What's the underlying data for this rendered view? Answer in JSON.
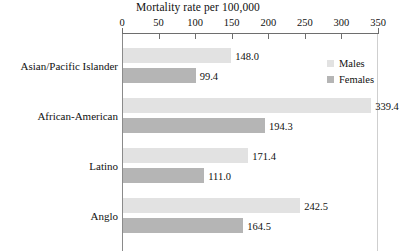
{
  "chart_data": {
    "type": "bar",
    "orientation": "horizontal",
    "title": "Mortality rate per 100,000",
    "xlabel": "",
    "ylabel": "",
    "xlim": [
      0,
      350
    ],
    "xticks": [
      0,
      50,
      100,
      150,
      200,
      250,
      300,
      350
    ],
    "xtick_labels": [
      "0",
      "50",
      "100",
      "150",
      "200",
      "250",
      "300",
      "350"
    ],
    "grid": false,
    "legend_position": "top-right",
    "categories": [
      "Asian/Pacific Islander",
      "African-American",
      "Latino",
      "Anglo"
    ],
    "series": [
      {
        "name": "Males",
        "color": "#e2e2e2",
        "values": [
          148.0,
          339.4,
          171.4,
          242.5
        ],
        "value_labels": [
          "148.0",
          "339.4",
          "171.4",
          "242.5"
        ]
      },
      {
        "name": "Females",
        "color": "#b5b5b5",
        "values": [
          99.4,
          194.3,
          111.0,
          164.5
        ],
        "value_labels": [
          "99.4",
          "194.3",
          "111.0",
          "164.5"
        ]
      }
    ]
  },
  "legend": {
    "items": [
      {
        "label": "Males",
        "color": "#e2e2e2"
      },
      {
        "label": "Females",
        "color": "#b5b5b5"
      }
    ]
  }
}
